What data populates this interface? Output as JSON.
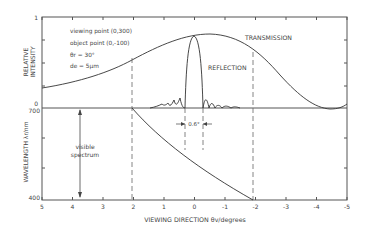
{
  "chart_data": [
    {
      "type": "line",
      "panel": "top",
      "title": "",
      "xlabel": "VIEWING DIRECTION θv/degrees",
      "ylabel": "RELATIVE INTENSITY",
      "xlim": [
        5,
        -5
      ],
      "ylim": [
        0,
        1
      ],
      "y_tick_labels": [
        "0",
        "1"
      ],
      "annotations": [
        "viewing point (0,300)",
        "object point (0,-100)",
        "θr = 30°",
        "de = 5μm",
        "0.6°"
      ],
      "series": [
        {
          "name": "TRANSMISSION",
          "x": [
            5,
            4,
            3,
            2,
            1,
            0,
            -0.5,
            -1,
            -2,
            -3,
            -4,
            -4.5,
            -5
          ],
          "values": [
            0.22,
            0.32,
            0.45,
            0.62,
            0.78,
            0.86,
            0.87,
            0.84,
            0.62,
            0.28,
            0.04,
            0.0,
            0.05
          ]
        },
        {
          "name": "REFLECTION",
          "x": [
            2.0,
            1.0,
            0.6,
            0.4,
            0.3,
            0.2,
            0.0,
            -0.2,
            -0.3,
            -0.4,
            -0.6,
            -1.0,
            -1.5
          ],
          "values": [
            0.0,
            0.02,
            0.06,
            0.12,
            0.0,
            0.85,
            0.88,
            0.85,
            0.0,
            0.12,
            0.06,
            0.02,
            0.0
          ]
        }
      ],
      "grid": false,
      "legend": "inline labels"
    },
    {
      "type": "line",
      "panel": "bottom",
      "xlabel": "VIEWING DIRECTION θv/degrees",
      "ylabel": "WAVELENGTH λr/nm",
      "xlim": [
        5,
        -5
      ],
      "ylim": [
        400,
        700
      ],
      "y_tick_labels": [
        "400",
        "700"
      ],
      "annotations": [
        "visible spectrum"
      ],
      "series": [
        {
          "name": "wavelength",
          "x": [
            5,
            4,
            3,
            2,
            1,
            0,
            -1,
            -2
          ],
          "values": [
            700,
            700,
            700,
            700,
            620,
            540,
            465,
            400
          ]
        }
      ],
      "grid": false
    }
  ],
  "labels": {
    "y_top": "RELATIVE INTENSITY",
    "y_bottom": "WAVELENGTH λr/nm",
    "x_title": "VIEWING DIRECTION  θv/degrees",
    "transmission": "TRANSMISSION",
    "reflection": "REFLECTION",
    "viewing_point": "viewing point  (0,300)",
    "object_point": "object point  (0,-100)",
    "theta_r": "θr = 30°",
    "d_e": "de = 5μm",
    "visible": "visible",
    "spectrum": "spectrum",
    "peak_width": "0.6°",
    "y_one": "1",
    "y_zero": "0",
    "y_700": "700",
    "y_400": "400"
  },
  "x_ticks": [
    "5",
    "4",
    "3",
    "2",
    "1",
    "0",
    "-1",
    "-2",
    "-3",
    "-4",
    "-5"
  ]
}
